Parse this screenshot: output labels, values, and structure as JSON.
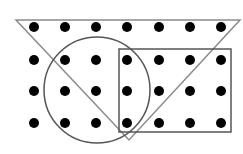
{
  "diagram": {
    "width": 243,
    "height": 154,
    "background": "#ffffff",
    "dot_color": "#000000",
    "dot_radius": 5,
    "dot_columns_x": [
      34,
      65,
      96,
      127,
      159,
      190,
      221
    ],
    "dot_rows_y": [
      27,
      60,
      91,
      123
    ],
    "triangle": {
      "points": "16,20 240,20 129,140",
      "stroke": "#8a8a8a",
      "stroke_width": 1.5
    },
    "circle": {
      "cx": 97,
      "cy": 90,
      "r": 53,
      "stroke": "#555555",
      "stroke_width": 1.5
    },
    "rectangle": {
      "x": 119,
      "y": 49,
      "width": 112,
      "height": 83,
      "stroke": "#555555",
      "stroke_width": 1.5
    }
  }
}
